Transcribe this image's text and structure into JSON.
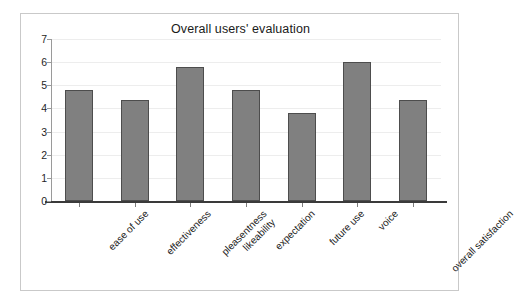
{
  "chart_data": {
    "type": "bar",
    "title": "Overall users' evaluation",
    "xlabel": "",
    "ylabel": "",
    "ylim": [
      0,
      7
    ],
    "ytick_labels": [
      "7",
      "6",
      "5",
      "4",
      "3",
      "2",
      "1",
      "0"
    ],
    "ytick_values": [
      7,
      6,
      5,
      4,
      3,
      2,
      1,
      0
    ],
    "grid": true,
    "legend": false,
    "categories": [
      "ease of use",
      "effectiveness",
      "pleasentness likeability",
      "expectation",
      "future use",
      "voice",
      "overall satisfaction"
    ],
    "category_label_lines": [
      [
        "ease of use"
      ],
      [
        "effectiveness"
      ],
      [
        "pleasentness",
        "likeability"
      ],
      [
        "expectation"
      ],
      [
        "future use"
      ],
      [
        "voice"
      ],
      [
        "overall satisfaction"
      ]
    ],
    "values": [
      4.8,
      4.35,
      5.8,
      4.8,
      3.8,
      6.0,
      4.35
    ],
    "bar_color": "#808080",
    "bar_border_color": "#4d4d4d",
    "axis_color": "#3a3a3a",
    "grid_color": "#ededed",
    "frame_color": "#c9c9c9",
    "background_color": "#ffffff"
  }
}
